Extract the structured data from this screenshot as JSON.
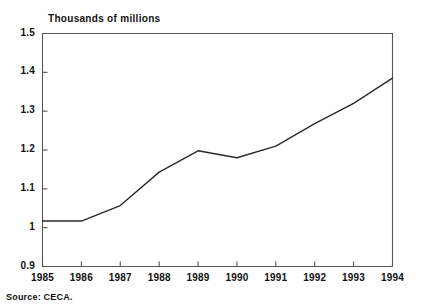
{
  "chart_data": {
    "type": "line",
    "title": "Thousands of millions",
    "xlabel": "",
    "ylabel": "",
    "categories": [
      "1985",
      "1986",
      "1987",
      "1988",
      "1989",
      "1990",
      "1991",
      "1992",
      "1993",
      "1994"
    ],
    "x": [
      1985,
      1986,
      1987,
      1988,
      1989,
      1990,
      1991,
      1992,
      1993,
      1994
    ],
    "values": [
      1.017,
      1.017,
      1.057,
      1.143,
      1.198,
      1.18,
      1.21,
      1.268,
      1.32,
      1.385
    ],
    "series": [
      {
        "name": "Thousands of millions",
        "values": [
          1.017,
          1.017,
          1.057,
          1.143,
          1.198,
          1.18,
          1.21,
          1.268,
          1.32,
          1.385
        ]
      }
    ],
    "ylim": [
      0.9,
      1.5
    ],
    "xlim": [
      1985,
      1994
    ],
    "yticks": [
      0.9,
      1.0,
      1.1,
      1.2,
      1.3,
      1.4,
      1.5
    ],
    "ytick_labels": [
      "0.9",
      "1",
      "1.1",
      "1.2",
      "1.3",
      "1.4",
      "1.5"
    ],
    "xticks": [
      1985,
      1986,
      1987,
      1988,
      1989,
      1990,
      1991,
      1992,
      1993,
      1994
    ],
    "xtick_labels": [
      "1985",
      "1986",
      "1987",
      "1988",
      "1989",
      "1990",
      "1991",
      "1992",
      "1993",
      "1994"
    ],
    "grid": false,
    "legend": false,
    "legend_position": "none",
    "line_color": "#2b2b2b",
    "axis_color": "#555555",
    "background_color": "#ffffff"
  },
  "source": {
    "text": "Source: CECA."
  }
}
